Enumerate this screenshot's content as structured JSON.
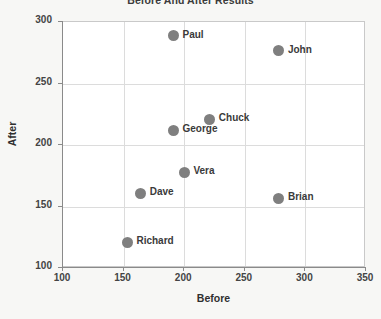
{
  "chart_data": {
    "type": "scatter",
    "title": "Before And After Results",
    "xlabel": "Before",
    "ylabel": "After",
    "xlim": [
      100,
      350
    ],
    "ylim": [
      100,
      300
    ],
    "xticks": [
      100,
      150,
      200,
      250,
      300,
      350
    ],
    "yticks": [
      100,
      150,
      200,
      250,
      300
    ],
    "grid": true,
    "legend": "none",
    "marker_color": "#7f7f7f",
    "points": [
      {
        "label": "Paul",
        "x": 192,
        "y": 288
      },
      {
        "label": "John",
        "x": 279,
        "y": 276
      },
      {
        "label": "Chuck",
        "x": 222,
        "y": 220
      },
      {
        "label": "George",
        "x": 192,
        "y": 211
      },
      {
        "label": "Vera",
        "x": 201,
        "y": 177
      },
      {
        "label": "Dave",
        "x": 165,
        "y": 160
      },
      {
        "label": "Brian",
        "x": 279,
        "y": 156
      },
      {
        "label": "Richard",
        "x": 154,
        "y": 120
      }
    ]
  }
}
